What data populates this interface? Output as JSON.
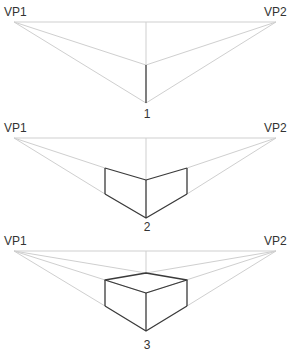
{
  "diagram": {
    "title": "",
    "colors": {
      "guide": "#cfcfcf",
      "edge": "#3a3a3a",
      "text": "#333333"
    },
    "panels": [
      {
        "step": "1",
        "vp1_label": "VP1",
        "vp2_label": "VP2"
      },
      {
        "step": "2",
        "vp1_label": "VP1",
        "vp2_label": "VP2"
      },
      {
        "step": "3",
        "vp1_label": "VP1",
        "vp2_label": "VP2"
      }
    ]
  }
}
